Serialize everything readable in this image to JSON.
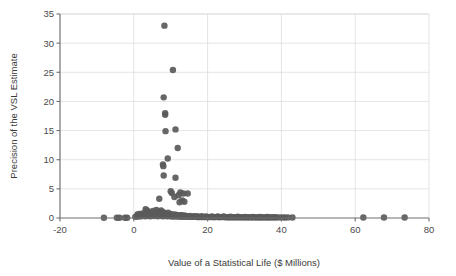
{
  "chart_data": {
    "type": "scatter",
    "title": "",
    "xlabel": "Value of a Statistical Life ($ Millions)",
    "ylabel": "Precision of the VSL Estimate",
    "xlim": [
      -20,
      80
    ],
    "ylim": [
      0,
      35
    ],
    "xticks": [
      -20,
      0,
      20,
      40,
      60,
      80
    ],
    "yticks": [
      0,
      5,
      10,
      15,
      20,
      25,
      30,
      35
    ],
    "xtick_labels": [
      "-20",
      "0",
      "20",
      "40",
      "60",
      "80"
    ],
    "ytick_labels": [
      "0",
      "5",
      "10",
      "15",
      "20",
      "25",
      "30",
      "35"
    ],
    "grid": "horizontal-and-vertical",
    "legend": "none",
    "marker_color": "#5a5a5a",
    "marker_size": 4.2,
    "series": [
      {
        "name": "VSL estimates",
        "points": [
          [
            8.3,
            33.0
          ],
          [
            10.6,
            25.4
          ],
          [
            8.1,
            20.7
          ],
          [
            8.5,
            18.0
          ],
          [
            8.5,
            17.7
          ],
          [
            11.3,
            15.2
          ],
          [
            8.6,
            14.9
          ],
          [
            11.9,
            12.0
          ],
          [
            9.2,
            10.2
          ],
          [
            7.9,
            9.2
          ],
          [
            8.0,
            8.9
          ],
          [
            11.3,
            6.9
          ],
          [
            8.1,
            7.3
          ],
          [
            10.0,
            4.6
          ],
          [
            10.3,
            4.3
          ],
          [
            12.6,
            4.4
          ],
          [
            13.4,
            4.2
          ],
          [
            14.6,
            4.2
          ],
          [
            12.1,
            3.9
          ],
          [
            11.0,
            3.6
          ],
          [
            6.9,
            3.3
          ],
          [
            13.1,
            3.0
          ],
          [
            13.7,
            2.8
          ],
          [
            12.4,
            2.7
          ],
          [
            3.2,
            1.5
          ],
          [
            3.6,
            1.3
          ],
          [
            5.2,
            1.2
          ],
          [
            6.1,
            1.4
          ],
          [
            6.8,
            1.1
          ],
          [
            7.4,
            1.3
          ],
          [
            8.0,
            1.0
          ],
          [
            4.4,
            1.0
          ],
          [
            5.8,
            0.9
          ],
          [
            6.4,
            0.8
          ],
          [
            7.1,
            0.9
          ],
          [
            7.8,
            0.7
          ],
          [
            8.6,
            0.8
          ],
          [
            9.3,
            0.9
          ],
          [
            9.9,
            0.7
          ],
          [
            10.5,
            0.6
          ],
          [
            2.4,
            0.8
          ],
          [
            3.0,
            0.7
          ],
          [
            3.8,
            0.6
          ],
          [
            4.8,
            0.7
          ],
          [
            5.4,
            0.6
          ],
          [
            11.2,
            0.6
          ],
          [
            11.8,
            0.5
          ],
          [
            12.5,
            0.5
          ],
          [
            13.2,
            0.5
          ],
          [
            14.0,
            0.4
          ],
          [
            -8.1,
            0.05
          ],
          [
            -4.6,
            0.05
          ],
          [
            -3.9,
            0.05
          ],
          [
            -2.4,
            0.05
          ],
          [
            -1.8,
            0.05
          ],
          [
            0.4,
            0.2
          ],
          [
            0.9,
            0.3
          ],
          [
            1.3,
            0.25
          ],
          [
            1.7,
            0.35
          ],
          [
            2.1,
            0.3
          ],
          [
            2.6,
            0.4
          ],
          [
            3.1,
            0.3
          ],
          [
            3.5,
            0.45
          ],
          [
            4.0,
            0.35
          ],
          [
            4.5,
            0.3
          ],
          [
            5.0,
            0.4
          ],
          [
            5.5,
            0.35
          ],
          [
            6.0,
            0.45
          ],
          [
            6.5,
            0.3
          ],
          [
            7.0,
            0.4
          ],
          [
            7.5,
            0.35
          ],
          [
            8.0,
            0.3
          ],
          [
            8.5,
            0.4
          ],
          [
            9.0,
            0.3
          ],
          [
            9.5,
            0.35
          ],
          [
            10.0,
            0.3
          ],
          [
            10.5,
            0.25
          ],
          [
            11.0,
            0.3
          ],
          [
            11.5,
            0.25
          ],
          [
            12.0,
            0.3
          ],
          [
            12.5,
            0.2
          ],
          [
            13.0,
            0.25
          ],
          [
            13.5,
            0.2
          ],
          [
            14.0,
            0.25
          ],
          [
            14.5,
            0.2
          ],
          [
            15.0,
            0.25
          ],
          [
            15.5,
            0.2
          ],
          [
            16.0,
            0.2
          ],
          [
            16.5,
            0.25
          ],
          [
            17.0,
            0.2
          ],
          [
            17.5,
            0.15
          ],
          [
            18.0,
            0.2
          ],
          [
            18.5,
            0.15
          ],
          [
            19.0,
            0.2
          ],
          [
            19.5,
            0.15
          ],
          [
            20.0,
            0.2
          ],
          [
            20.5,
            0.15
          ],
          [
            21.0,
            0.2
          ],
          [
            21.5,
            0.15
          ],
          [
            22.0,
            0.15
          ],
          [
            22.5,
            0.2
          ],
          [
            23.0,
            0.15
          ],
          [
            23.5,
            0.15
          ],
          [
            24.0,
            0.2
          ],
          [
            24.5,
            0.15
          ],
          [
            25.0,
            0.15
          ],
          [
            25.5,
            0.1
          ],
          [
            26.0,
            0.15
          ],
          [
            26.5,
            0.1
          ],
          [
            27.0,
            0.15
          ],
          [
            27.5,
            0.1
          ],
          [
            28.0,
            0.15
          ],
          [
            28.5,
            0.1
          ],
          [
            29.0,
            0.15
          ],
          [
            29.5,
            0.1
          ],
          [
            30.0,
            0.12
          ],
          [
            30.5,
            0.1
          ],
          [
            31.0,
            0.12
          ],
          [
            31.5,
            0.1
          ],
          [
            32.0,
            0.12
          ],
          [
            32.5,
            0.1
          ],
          [
            33.0,
            0.12
          ],
          [
            33.5,
            0.1
          ],
          [
            34.0,
            0.1
          ],
          [
            34.5,
            0.12
          ],
          [
            35.0,
            0.1
          ],
          [
            35.5,
            0.1
          ],
          [
            36.0,
            0.12
          ],
          [
            36.5,
            0.1
          ],
          [
            37.0,
            0.1
          ],
          [
            37.5,
            0.12
          ],
          [
            38.0,
            0.1
          ],
          [
            38.8,
            0.1
          ],
          [
            39.6,
            0.1
          ],
          [
            40.3,
            0.1
          ],
          [
            41.0,
            0.08
          ],
          [
            41.8,
            0.1
          ],
          [
            43.0,
            0.08
          ],
          [
            62.2,
            0.08
          ],
          [
            67.8,
            0.08
          ],
          [
            73.4,
            0.08
          ],
          [
            1.0,
            0.6
          ],
          [
            1.5,
            0.7
          ],
          [
            2.0,
            0.55
          ],
          [
            2.8,
            0.6
          ],
          [
            3.3,
            0.5
          ],
          [
            4.2,
            0.55
          ],
          [
            4.9,
            0.5
          ],
          [
            5.7,
            0.55
          ],
          [
            6.3,
            0.5
          ],
          [
            7.2,
            0.55
          ],
          [
            8.2,
            0.5
          ],
          [
            9.1,
            0.45
          ],
          [
            9.8,
            0.5
          ],
          [
            10.8,
            0.45
          ],
          [
            11.6,
            0.4
          ],
          [
            12.8,
            0.4
          ],
          [
            13.8,
            0.35
          ],
          [
            15.2,
            0.35
          ],
          [
            16.2,
            0.3
          ],
          [
            17.2,
            0.3
          ],
          [
            18.4,
            0.3
          ],
          [
            19.6,
            0.28
          ],
          [
            21.2,
            0.28
          ],
          [
            22.8,
            0.25
          ],
          [
            24.4,
            0.25
          ],
          [
            26.2,
            0.22
          ],
          [
            28.2,
            0.22
          ],
          [
            30.2,
            0.2
          ],
          [
            32.2,
            0.2
          ],
          [
            34.2,
            0.18
          ],
          [
            36.2,
            0.18
          ],
          [
            38.4,
            0.15
          ]
        ]
      }
    ]
  },
  "axes": {
    "x_title": "Value of a Statistical Life ($ Millions)",
    "y_title": "Precision of the VSL Estimate"
  }
}
